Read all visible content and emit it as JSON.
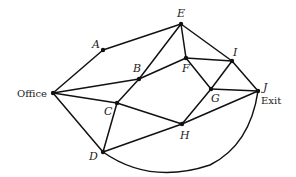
{
  "diagram": {
    "type": "graph",
    "nodes": [
      {
        "id": "Office",
        "label": "Office",
        "x": 53,
        "y": 93,
        "lx": 17,
        "ly": 97,
        "style": "roman"
      },
      {
        "id": "A",
        "label": "A",
        "x": 103,
        "y": 50,
        "lx": 92,
        "ly": 48,
        "style": "italic"
      },
      {
        "id": "B",
        "label": "B",
        "x": 139,
        "y": 79,
        "lx": 133,
        "ly": 72,
        "style": "italic"
      },
      {
        "id": "C",
        "label": "C",
        "x": 117,
        "y": 103,
        "lx": 104,
        "ly": 115,
        "style": "italic"
      },
      {
        "id": "D",
        "label": "D",
        "x": 103,
        "y": 152,
        "lx": 89,
        "ly": 160,
        "style": "italic"
      },
      {
        "id": "E",
        "label": "E",
        "x": 181,
        "y": 24,
        "lx": 177,
        "ly": 17,
        "style": "italic"
      },
      {
        "id": "F",
        "label": "F",
        "x": 186,
        "y": 58,
        "lx": 182,
        "ly": 72,
        "style": "italic"
      },
      {
        "id": "G",
        "label": "G",
        "x": 211,
        "y": 89,
        "lx": 211,
        "ly": 102,
        "style": "italic"
      },
      {
        "id": "H",
        "label": "H",
        "x": 182,
        "y": 124,
        "lx": 180,
        "ly": 139,
        "style": "italic"
      },
      {
        "id": "I",
        "label": "I",
        "x": 232,
        "y": 61,
        "lx": 233,
        "ly": 56,
        "style": "italic"
      },
      {
        "id": "J",
        "label": "J",
        "x": 258,
        "y": 91,
        "lx": 263,
        "ly": 91,
        "style": "italic"
      }
    ],
    "exit_label": {
      "text": "Exit",
      "x": 261,
      "y": 104
    },
    "edges": [
      [
        "Office",
        "A"
      ],
      [
        "A",
        "E"
      ],
      [
        "Office",
        "B"
      ],
      [
        "B",
        "F"
      ],
      [
        "C",
        "B"
      ],
      [
        "B",
        "E"
      ],
      [
        "E",
        "F"
      ],
      [
        "E",
        "I"
      ],
      [
        "F",
        "I"
      ],
      [
        "F",
        "G"
      ],
      [
        "G",
        "I"
      ],
      [
        "I",
        "J"
      ],
      [
        "G",
        "J"
      ],
      [
        "Office",
        "C"
      ],
      [
        "Office",
        "D"
      ],
      [
        "C",
        "D"
      ],
      [
        "C",
        "H"
      ],
      [
        "D",
        "H"
      ],
      [
        "H",
        "G"
      ],
      [
        "H",
        "J"
      ]
    ],
    "curved_edges": [
      {
        "from": "D",
        "to": "J",
        "path": "M103,152 Q150,185 210,165 Q250,145 258,91"
      }
    ]
  }
}
